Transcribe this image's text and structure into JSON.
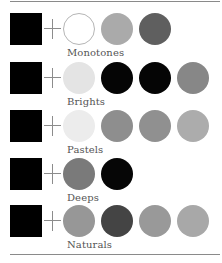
{
  "groups": [
    {
      "label": "Monotones",
      "base": "#000000",
      "swatches": [
        {
          "color": "#ffffff",
          "outlined": true
        },
        {
          "color": "#aaaaaa"
        },
        {
          "color": "#5f5f5f"
        }
      ]
    },
    {
      "label": "Brights",
      "base": "#000000",
      "swatches": [
        {
          "color": "#e4e4e4"
        },
        {
          "color": "#050505"
        },
        {
          "color": "#050505"
        },
        {
          "color": "#878787"
        }
      ]
    },
    {
      "label": "Pastels",
      "base": "#000000",
      "swatches": [
        {
          "color": "#ececec"
        },
        {
          "color": "#8e8e8e"
        },
        {
          "color": "#909090"
        },
        {
          "color": "#acacac"
        }
      ]
    },
    {
      "label": "Deeps",
      "base": "#000000",
      "swatches": [
        {
          "color": "#7a7a7a"
        },
        {
          "color": "#060606"
        }
      ]
    },
    {
      "label": "Naturals",
      "base": "#000000",
      "swatches": [
        {
          "color": "#979797"
        },
        {
          "color": "#444444"
        },
        {
          "color": "#999999"
        },
        {
          "color": "#a8a8a8"
        }
      ]
    }
  ],
  "plus_symbol": "+"
}
